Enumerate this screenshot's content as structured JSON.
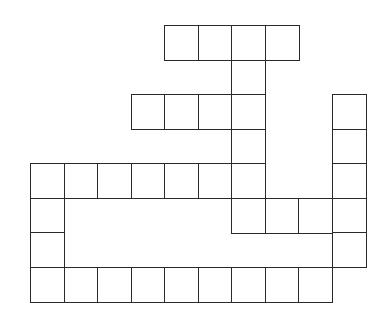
{
  "puzzle": {
    "type": "crossword-grid",
    "origin": {
      "x": 30,
      "y": 25
    },
    "cell_width": 33.5,
    "cell_height": 34.5,
    "line_color": "#2a2a2a",
    "background": "#ffffff",
    "rows": [
      {
        "row": 0,
        "cols": [
          4,
          5,
          6,
          7
        ]
      },
      {
        "row": 1,
        "cols": [
          6
        ]
      },
      {
        "row": 2,
        "cols": [
          3,
          4,
          5,
          6,
          9
        ]
      },
      {
        "row": 3,
        "cols": [
          6,
          9
        ]
      },
      {
        "row": 4,
        "cols": [
          0,
          1,
          2,
          3,
          4,
          5,
          6,
          9
        ]
      },
      {
        "row": 5,
        "cols": [
          0,
          6,
          7,
          8,
          9
        ]
      },
      {
        "row": 6,
        "cols": [
          0,
          9
        ]
      },
      {
        "row": 7,
        "cols": [
          0,
          1,
          2,
          3,
          4,
          5,
          6,
          7,
          8
        ]
      }
    ]
  }
}
